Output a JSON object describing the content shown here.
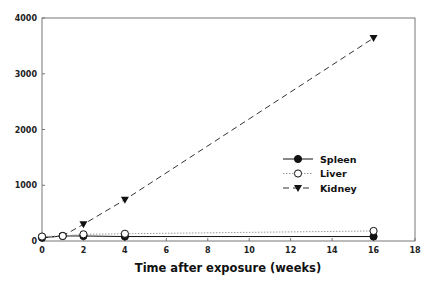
{
  "chart_data": {
    "type": "line",
    "title": "",
    "xlabel": "Time after exposure (weeks)",
    "ylabel": "",
    "xlim": [
      0,
      18
    ],
    "ylim": [
      0,
      4000
    ],
    "x_ticks": [
      0,
      2,
      4,
      6,
      8,
      10,
      12,
      14,
      16,
      18
    ],
    "y_ticks": [
      0,
      1000,
      2000,
      3000,
      4000
    ],
    "grid": false,
    "legend_position": "center-right",
    "series": [
      {
        "name": "Spleen",
        "style": "solid",
        "marker": "filled-circle",
        "x": [
          0,
          1,
          2,
          4,
          16
        ],
        "values": [
          60,
          90,
          90,
          80,
          80
        ]
      },
      {
        "name": "Liver",
        "style": "dotted",
        "marker": "open-circle",
        "x": [
          0,
          1,
          2,
          4,
          16
        ],
        "values": [
          80,
          90,
          120,
          130,
          180
        ]
      },
      {
        "name": "Kidney",
        "style": "dashed",
        "marker": "filled-triangle-down",
        "x": [
          0,
          1,
          2,
          4,
          16
        ],
        "values": [
          60,
          90,
          300,
          740,
          3640
        ]
      }
    ]
  },
  "labels": {
    "xlabel": "Time after exposure (weeks)",
    "legend": [
      "Spleen",
      "Liver",
      "Kidney"
    ],
    "x_ticks": [
      "0",
      "2",
      "4",
      "6",
      "8",
      "10",
      "12",
      "14",
      "16",
      "18"
    ],
    "y_ticks": [
      "0",
      "1000",
      "2000",
      "3000",
      "4000"
    ]
  },
  "colors": {
    "axis": "#777777",
    "series": "#111111",
    "liver_line": "#999999"
  }
}
